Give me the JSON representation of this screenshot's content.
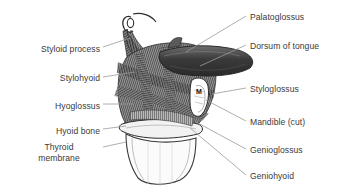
{
  "figure": {
    "background_color": "#ffffff",
    "text_color": "#3a3a3a",
    "leader_color": "#9a9a9a"
  },
  "labels_left": [
    {
      "text": "Styloid process",
      "x": 18,
      "y": 44,
      "w": 82,
      "align": "right"
    },
    {
      "text": "Stylohyoid",
      "x": 18,
      "y": 73,
      "w": 82,
      "align": "right"
    },
    {
      "text": "Hyoglossus",
      "x": 18,
      "y": 101,
      "w": 82,
      "align": "right"
    },
    {
      "text": "Hyoid bone",
      "x": 18,
      "y": 126,
      "w": 82,
      "align": "right"
    },
    {
      "text": "Thyroid\nmembrane",
      "x": 18,
      "y": 142,
      "w": 82,
      "align": "center"
    }
  ],
  "labels_right": [
    {
      "text": "Palatoglossus",
      "x": 250,
      "y": 12
    },
    {
      "text": "Dorsum of tongue",
      "x": 250,
      "y": 41
    },
    {
      "text": "Styloglossus",
      "x": 250,
      "y": 84
    },
    {
      "text": "Mandible (cut)",
      "x": 250,
      "y": 117
    },
    {
      "text": "Genioglossus",
      "x": 250,
      "y": 145
    },
    {
      "text": "Geniohyoid",
      "x": 250,
      "y": 171
    }
  ],
  "markers": [
    {
      "text": "M",
      "x": 196,
      "y": 88
    }
  ],
  "leaders": [
    {
      "name": "leader-styloid-process",
      "x1": 103,
      "y1": 47,
      "x2": 130,
      "y2": 38
    },
    {
      "name": "leader-stylohyoid",
      "x1": 103,
      "y1": 77,
      "x2": 135,
      "y2": 72
    },
    {
      "name": "leader-hyoglossus",
      "x1": 103,
      "y1": 104,
      "x2": 133,
      "y2": 104
    },
    {
      "name": "leader-hyoid-bone",
      "x1": 103,
      "y1": 129,
      "x2": 126,
      "y2": 126
    },
    {
      "name": "leader-thyroid-membrane",
      "x1": 103,
      "y1": 147,
      "x2": 126,
      "y2": 142
    },
    {
      "name": "leader-palatoglossus",
      "x1": 246,
      "y1": 16,
      "x2": 186,
      "y2": 52
    },
    {
      "name": "leader-dorsum-of-tongue",
      "x1": 246,
      "y1": 45,
      "x2": 200,
      "y2": 66
    },
    {
      "name": "leader-styloglossus",
      "x1": 246,
      "y1": 88,
      "x2": 212,
      "y2": 94
    },
    {
      "name": "leader-mandible-cut",
      "x1": 246,
      "y1": 121,
      "x2": 206,
      "y2": 100
    },
    {
      "name": "leader-genioglossus",
      "x1": 246,
      "y1": 149,
      "x2": 196,
      "y2": 122
    },
    {
      "name": "leader-geniohyoid",
      "x1": 246,
      "y1": 175,
      "x2": 190,
      "y2": 128
    }
  ]
}
